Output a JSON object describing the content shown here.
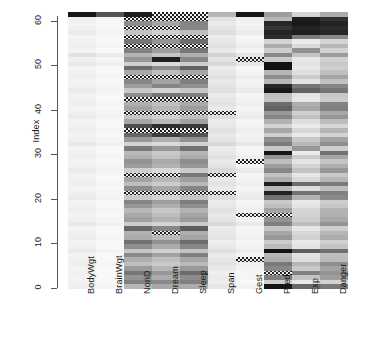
{
  "figure": {
    "type": "heatmap",
    "background": "#ffffff",
    "na_pattern": "checkered-hatch"
  },
  "y_axis": {
    "title": "Index",
    "ticks": [
      0,
      10,
      20,
      30,
      40,
      50,
      60
    ],
    "min": 0,
    "max": 62
  },
  "x_axis": {
    "labels": [
      "BodyWgt",
      "BrainWgt",
      "NonD",
      "Dream",
      "Sleep",
      "Span",
      "Gest",
      "Pred",
      "Exp",
      "Danger"
    ]
  },
  "chart_data": {
    "type": "heatmap",
    "title": "",
    "xlabel": "",
    "ylabel": "Index",
    "columns": [
      "BodyWgt",
      "BrainWgt",
      "NonD",
      "Dream",
      "Sleep",
      "Span",
      "Gest",
      "Pred",
      "Exp",
      "Danger"
    ],
    "rows": 62,
    "ylim": [
      0,
      62
    ],
    "grid": false,
    "legend": "none",
    "colormap": "grayscale-reverse",
    "value_range": [
      0,
      1
    ],
    "na_marker": "hatched",
    "note": "Grayscale intensity heatmap of scaled mammal sleep variables; hatched cells denote NA (missing) values.",
    "matrix": [
      [
        0.07,
        0.04,
        0.3,
        0.36,
        0.34,
        0.1,
        0.05,
        0.95,
        0.62,
        0.55
      ],
      [
        0.06,
        0.03,
        0.52,
        0.48,
        0.52,
        0.07,
        0.03,
        0.2,
        0.1,
        0.18
      ],
      [
        0.05,
        0.03,
        0.44,
        0.34,
        0.47,
        0.08,
        0.04,
        0.52,
        0.24,
        0.4
      ],
      [
        0.06,
        0.03,
        0.56,
        0.42,
        0.6,
        0.06,
        0.04,
        "NA",
        0.52,
        0.44
      ],
      [
        0.05,
        0.03,
        0.41,
        0.3,
        0.42,
        0.09,
        0.05,
        0.48,
        0.22,
        0.38
      ],
      [
        0.07,
        0.04,
        0.26,
        0.22,
        0.28,
        0.12,
        0.07,
        0.55,
        0.3,
        0.46
      ],
      [
        0.06,
        0.03,
        0.33,
        0.26,
        0.36,
        0.1,
        "NA",
        0.33,
        0.14,
        0.28
      ],
      [
        0.05,
        0.03,
        0.48,
        0.38,
        0.52,
        0.08,
        0.05,
        0.3,
        0.12,
        0.26
      ],
      [
        0.08,
        0.05,
        0.24,
        0.19,
        0.25,
        0.13,
        0.08,
        0.96,
        0.66,
        0.58
      ],
      [
        0.06,
        0.03,
        0.46,
        0.34,
        0.49,
        0.09,
        0.05,
        0.28,
        0.11,
        0.24
      ],
      [
        0.05,
        0.03,
        0.58,
        0.45,
        0.6,
        0.07,
        0.04,
        0.21,
        0.09,
        0.19
      ],
      [
        0.07,
        0.04,
        0.34,
        0.28,
        0.37,
        0.11,
        0.06,
        0.42,
        0.19,
        0.34
      ],
      [
        0.06,
        0.03,
        0.31,
        "NA",
        0.33,
        0.1,
        0.05,
        0.36,
        0.16,
        0.3
      ],
      [
        0.05,
        0.03,
        0.62,
        0.49,
        0.66,
        0.08,
        0.04,
        0.24,
        0.1,
        0.21
      ],
      [
        0.09,
        0.06,
        0.21,
        0.17,
        0.22,
        0.15,
        0.09,
        0.52,
        0.27,
        0.44
      ],
      [
        0.06,
        0.04,
        0.39,
        0.31,
        0.41,
        0.11,
        0.06,
        0.44,
        0.2,
        0.36
      ],
      [
        0.05,
        0.03,
        0.35,
        0.27,
        0.37,
        0.09,
        "NA",
        "NA",
        0.18,
        0.32
      ],
      [
        0.07,
        0.04,
        0.29,
        0.23,
        0.31,
        0.12,
        0.07,
        0.38,
        0.17,
        0.31
      ],
      [
        0.06,
        0.03,
        0.43,
        0.33,
        0.46,
        0.1,
        0.05,
        0.26,
        0.11,
        0.23
      ],
      [
        0.05,
        0.03,
        0.5,
        0.39,
        0.53,
        0.08,
        0.04,
        0.22,
        0.09,
        0.2
      ],
      [
        0.08,
        0.05,
        0.23,
        0.18,
        0.24,
        0.14,
        0.08,
        0.58,
        0.32,
        0.48
      ],
      [
        0.06,
        0.04,
        "NA",
        "NA",
        "NA",
        "NA",
        0.06,
        0.9,
        0.58,
        0.52
      ],
      [
        0.05,
        0.03,
        0.47,
        0.36,
        0.5,
        0.09,
        0.05,
        0.3,
        0.13,
        0.26
      ],
      [
        0.07,
        0.04,
        0.27,
        0.21,
        0.29,
        0.12,
        0.07,
        0.92,
        0.6,
        0.54
      ],
      [
        0.06,
        0.03,
        0.37,
        0.29,
        0.39,
        0.1,
        0.05,
        0.34,
        0.15,
        0.29
      ],
      [
        0.05,
        0.03,
        "NA",
        "NA",
        0.55,
        "NA",
        0.04,
        0.25,
        0.1,
        0.22
      ],
      [
        0.08,
        0.05,
        0.2,
        0.16,
        0.21,
        0.15,
        0.09,
        0.49,
        0.25,
        0.42
      ],
      [
        0.06,
        0.04,
        0.4,
        0.32,
        0.43,
        0.11,
        0.06,
        0.4,
        0.18,
        0.33
      ],
      [
        0.05,
        0.03,
        0.44,
        0.35,
        0.47,
        0.09,
        "NA",
        0.27,
        0.11,
        0.24
      ],
      [
        0.07,
        0.04,
        0.32,
        0.25,
        0.34,
        0.12,
        0.07,
        0.44,
        0.21,
        0.36
      ],
      [
        0.06,
        0.03,
        0.28,
        0.22,
        0.3,
        0.1,
        0.05,
        0.95,
        0.08,
        0.58
      ],
      [
        0.05,
        0.03,
        0.54,
        0.42,
        0.58,
        0.08,
        0.04,
        0.23,
        0.42,
        0.2
      ],
      [
        0.09,
        0.06,
        0.18,
        0.15,
        0.19,
        0.16,
        0.1,
        0.54,
        0.29,
        0.46
      ],
      [
        0.06,
        0.04,
        0.42,
        0.33,
        0.45,
        0.11,
        0.06,
        0.46,
        0.22,
        0.38
      ],
      [
        0.05,
        0.03,
        0.62,
        0.78,
        0.7,
        0.09,
        0.05,
        0.2,
        0.09,
        0.18
      ],
      [
        0.07,
        0.04,
        "NA",
        "NA",
        "NA",
        0.12,
        0.07,
        0.36,
        0.16,
        0.3
      ],
      [
        0.06,
        0.03,
        0.72,
        0.85,
        0.8,
        0.1,
        0.05,
        0.18,
        0.08,
        0.16
      ],
      [
        0.05,
        0.03,
        0.36,
        0.28,
        0.38,
        0.08,
        0.04,
        0.32,
        0.14,
        0.27
      ],
      [
        0.08,
        0.05,
        0.24,
        0.19,
        0.26,
        0.14,
        0.08,
        0.5,
        0.26,
        0.43
      ],
      [
        0.06,
        0.04,
        "NA",
        "NA",
        "NA",
        "NA",
        0.06,
        0.42,
        0.19,
        0.35
      ],
      [
        0.05,
        0.03,
        0.38,
        0.3,
        0.4,
        0.09,
        0.05,
        0.64,
        0.36,
        0.52
      ],
      [
        0.07,
        0.04,
        0.33,
        0.26,
        0.35,
        0.12,
        0.07,
        0.6,
        0.33,
        0.5
      ],
      [
        0.06,
        0.03,
        "NA",
        "NA",
        "NA",
        0.1,
        0.05,
        0.24,
        0.1,
        0.21
      ],
      [
        0.05,
        0.03,
        0.46,
        0.56,
        0.52,
        0.08,
        0.04,
        0.26,
        0.12,
        0.23
      ],
      [
        0.08,
        0.05,
        0.22,
        0.18,
        0.23,
        0.13,
        0.08,
        0.94,
        0.64,
        0.56
      ],
      [
        0.06,
        0.04,
        0.4,
        0.5,
        0.45,
        0.11,
        0.06,
        0.88,
        0.56,
        0.5
      ],
      [
        0.05,
        0.03,
        0.49,
        0.38,
        0.52,
        0.09,
        0.05,
        0.28,
        0.12,
        0.25
      ],
      [
        0.07,
        0.04,
        "NA",
        "NA",
        "NA",
        0.12,
        0.07,
        0.46,
        0.21,
        0.37
      ],
      [
        0.06,
        0.03,
        0.35,
        0.27,
        0.37,
        0.1,
        0.05,
        0.3,
        0.13,
        0.26
      ],
      [
        0.05,
        0.03,
        0.6,
        0.47,
        0.64,
        0.08,
        0.04,
        0.97,
        0.1,
        0.2
      ],
      [
        0.09,
        0.06,
        0.19,
        0.15,
        0.2,
        0.16,
        0.1,
        0.97,
        0.12,
        0.22
      ],
      [
        0.06,
        0.04,
        0.43,
        0.92,
        0.48,
        0.11,
        "NA",
        0.22,
        0.09,
        0.19
      ],
      [
        0.12,
        0.08,
        0.31,
        0.24,
        0.33,
        0.18,
        0.11,
        0.48,
        0.24,
        0.4
      ],
      [
        0.05,
        0.03,
        0.52,
        0.4,
        0.56,
        0.09,
        0.05,
        0.2,
        0.45,
        0.18
      ],
      [
        0.07,
        0.04,
        "NA",
        "NA",
        "NA",
        0.12,
        0.07,
        0.34,
        0.15,
        0.29
      ],
      [
        0.06,
        0.03,
        0.56,
        0.44,
        0.6,
        0.1,
        0.05,
        0.18,
        0.08,
        0.17
      ],
      [
        0.05,
        0.03,
        "NA",
        "NA",
        "NA",
        0.08,
        0.04,
        0.86,
        0.54,
        0.48
      ],
      [
        0.08,
        0.05,
        0.25,
        0.2,
        0.27,
        0.14,
        0.08,
        0.9,
        0.92,
        0.88
      ],
      [
        0.06,
        0.04,
        "NA",
        "NA",
        0.5,
        0.11,
        0.06,
        0.82,
        0.9,
        0.86
      ],
      [
        0.05,
        0.03,
        0.47,
        0.37,
        0.5,
        0.09,
        0.05,
        0.88,
        0.94,
        0.9
      ],
      [
        0.07,
        0.04,
        "NA",
        "NA",
        "NA",
        0.12,
        0.07,
        0.3,
        0.92,
        0.84
      ],
      [
        0.95,
        0.7,
        0.92,
        "NA",
        "NA",
        0.3,
        0.95,
        0.4,
        0.18,
        0.34
      ]
    ]
  }
}
